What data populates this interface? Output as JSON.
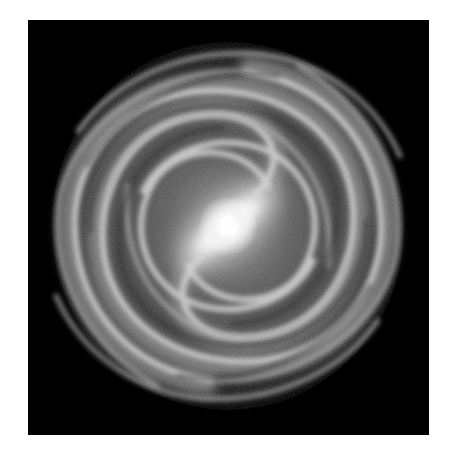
{
  "image": {
    "subject": "barred spiral galaxy",
    "description": "Grayscale top-down illustration of a barred spiral galaxy with a bright central bar and several wound spiral arms on a black background",
    "colors": {
      "page_background": "#ffffff",
      "panel_background": "#000000",
      "core": "#ffffff",
      "arms": "#bdbdbd",
      "diffuse_disc": "#5a5a5a"
    },
    "layout": {
      "panel": {
        "x": 28,
        "y": 20,
        "width": 401,
        "height": 415
      },
      "galaxy_center": {
        "x": 228,
        "y": 226
      },
      "disc_radius": 175,
      "bar_angle_deg": -40
    }
  }
}
